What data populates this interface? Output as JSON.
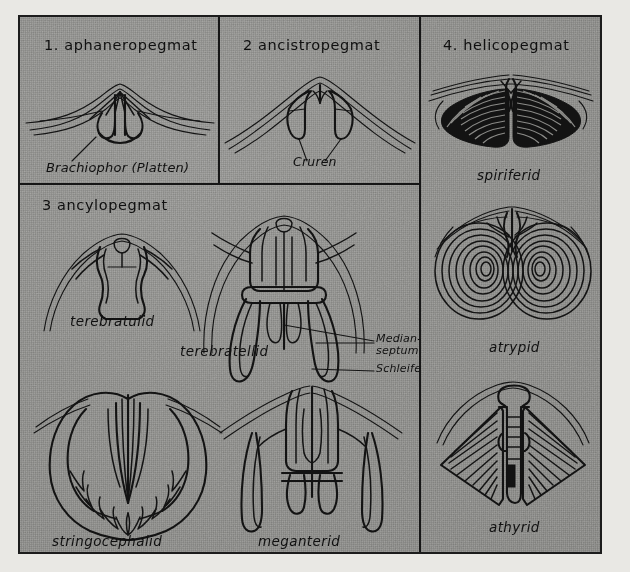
{
  "figure": {
    "background_color": "#8b8b88",
    "border_color": "#1c1c1c",
    "panels": [
      {
        "id": "aphaneropegmat",
        "title": "1. aphaneropegmat",
        "annotations": [
          {
            "text": "Brachiophor (Platten)"
          }
        ],
        "captions": []
      },
      {
        "id": "ancistropegmat",
        "title": "2 ancistropegmat",
        "annotations": [
          {
            "text": "Cruren"
          }
        ],
        "captions": []
      },
      {
        "id": "ancylopegmat",
        "title": "3 ancylopegmat",
        "annotations": [
          {
            "text": "Median-"
          },
          {
            "text": "septum"
          },
          {
            "text": "Schleife"
          }
        ],
        "captions": [
          {
            "text": "terebratulid"
          },
          {
            "text": "terebratellid"
          },
          {
            "text": "stringocephalid"
          },
          {
            "text": "meganterid"
          }
        ]
      },
      {
        "id": "helicopegmat",
        "title": "4. helicopegmat",
        "annotations": [],
        "captions": [
          {
            "text": "spiriferid"
          },
          {
            "text": "atrypid"
          },
          {
            "text": "athyrid"
          }
        ]
      }
    ]
  }
}
